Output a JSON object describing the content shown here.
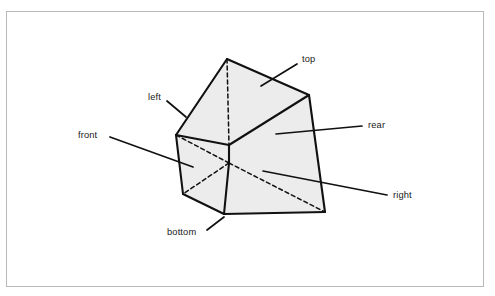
{
  "figure": {
    "kind": "technical-line-illustration",
    "border_color": "#b9b9b9",
    "background_color": "#ffffff",
    "face_fill_color": "#ececec",
    "edge_color": "#111111",
    "hidden_edge_style": "dashed",
    "leader_line_color": "#111111",
    "labels": [
      {
        "id": "top",
        "text": "top",
        "x": 302,
        "y": 62,
        "anchor": "start",
        "leader": [
          [
            297,
            64
          ],
          [
            261,
            86
          ]
        ]
      },
      {
        "id": "left",
        "text": "left",
        "x": 148,
        "y": 100,
        "anchor": "start",
        "leader": [
          [
            167,
            101
          ],
          [
            186,
            117
          ]
        ]
      },
      {
        "id": "front",
        "text": "front",
        "x": 78,
        "y": 138,
        "anchor": "start",
        "leader": [
          [
            110,
            137
          ],
          [
            193,
            167
          ]
        ]
      },
      {
        "id": "rear",
        "text": "rear",
        "x": 368,
        "y": 128,
        "anchor": "start",
        "leader": [
          [
            362,
            126
          ],
          [
            276,
            134
          ]
        ]
      },
      {
        "id": "right",
        "text": "right",
        "x": 393,
        "y": 198,
        "anchor": "start",
        "leader": [
          [
            387,
            195
          ],
          [
            263,
            171
          ]
        ]
      },
      {
        "id": "bottom",
        "text": "bottom",
        "x": 167,
        "y": 235,
        "anchor": "start",
        "leader": [
          [
            207,
            230
          ],
          [
            224,
            217
          ]
        ]
      }
    ],
    "geometry": {
      "vertices": {
        "apex_front": [
          227,
          59
        ],
        "apex_rear": [
          227,
          59
        ],
        "top_right_rear": [
          309,
          95
        ],
        "left_upper": [
          176,
          135
        ],
        "right_lower": [
          325,
          212
        ],
        "bottom_left": [
          183,
          194
        ],
        "bottom_mid": [
          224,
          214
        ],
        "front_lower_l": [
          176,
          135
        ],
        "ridge_hidden": [
          229,
          163
        ],
        "ridge_mid": [
          229,
          145
        ]
      },
      "faces": [
        {
          "id": "top",
          "points": "227,59 309,95 229,145 176,135"
        },
        {
          "id": "rear",
          "points": "309,95 325,212 229,163 229,145"
        },
        {
          "id": "front",
          "points": "176,135 229,145 229,163 224,214 183,194"
        },
        {
          "id": "right",
          "points": "229,145 229,163 224,214 325,212"
        }
      ],
      "solid_outline": "227,59 309,95 325,212 224,214 183,194 176,135",
      "solid_edges": [
        [
          [
            227,
            59
          ],
          [
            309,
            95
          ]
        ],
        [
          [
            309,
            95
          ],
          [
            325,
            212
          ]
        ],
        [
          [
            325,
            212
          ],
          [
            224,
            214
          ]
        ],
        [
          [
            224,
            214
          ],
          [
            183,
            194
          ]
        ],
        [
          [
            183,
            194
          ],
          [
            176,
            135
          ]
        ],
        [
          [
            176,
            135
          ],
          [
            227,
            59
          ]
        ],
        [
          [
            176,
            135
          ],
          [
            229,
            145
          ]
        ],
        [
          [
            229,
            145
          ],
          [
            309,
            95
          ]
        ],
        [
          [
            229,
            145
          ],
          [
            229,
            163
          ]
        ],
        [
          [
            229,
            163
          ],
          [
            224,
            214
          ]
        ]
      ],
      "hidden_edges": [
        [
          [
            227,
            59
          ],
          [
            229,
            145
          ]
        ],
        [
          [
            229,
            145
          ],
          [
            229,
            163
          ]
        ],
        [
          [
            229,
            163
          ],
          [
            183,
            194
          ]
        ],
        [
          [
            229,
            163
          ],
          [
            325,
            212
          ]
        ],
        [
          [
            176,
            135
          ],
          [
            229,
            163
          ]
        ]
      ]
    }
  }
}
